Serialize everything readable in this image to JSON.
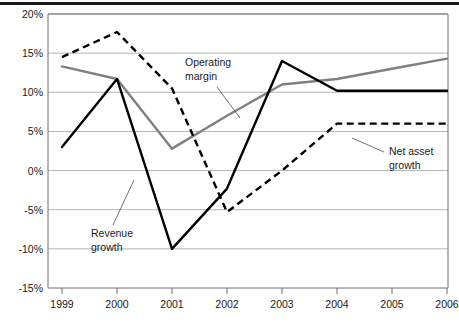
{
  "chart_data": {
    "type": "line",
    "title": "",
    "subtitle": "",
    "xlabel": "",
    "ylabel": "",
    "x": [
      "1999",
      "2000",
      "2001",
      "2002",
      "2003",
      "2004",
      "2005",
      "2006"
    ],
    "categories": [
      "1999",
      "2000",
      "2001",
      "2002",
      "2003",
      "2004",
      "2005",
      "2006"
    ],
    "ylim": [
      -15,
      20
    ],
    "yticks": [
      20,
      15,
      10,
      5,
      0,
      -5,
      -10,
      -15
    ],
    "ytick_labels": [
      "20%",
      "15%",
      "10%",
      "5%",
      "0%",
      "-5%",
      "-10%",
      "-15%"
    ],
    "xtick_labels": [
      "1999",
      "2000",
      "2001",
      "2002",
      "2003",
      "2004",
      "2005",
      "2006"
    ],
    "grid": true,
    "legend": "none",
    "series": [
      {
        "name": "Operating margin",
        "style": "solid",
        "color": "#808080",
        "values": [
          13.3,
          11.7,
          2.8,
          7.0,
          11.0,
          11.7,
          13.0,
          14.3
        ]
      },
      {
        "name": "Revenue growth",
        "style": "solid",
        "color": "#000000",
        "values": [
          3.0,
          11.7,
          -10.0,
          -2.3,
          14.0,
          10.2,
          10.2,
          10.2
        ]
      },
      {
        "name": "Net asset growth",
        "style": "dashed",
        "color": "#000000",
        "values": [
          14.5,
          17.7,
          10.5,
          -5.3,
          0.0,
          6.0,
          6.0,
          6.0
        ]
      }
    ],
    "annotations": [
      {
        "id": "operating-margin",
        "label_line1": "Operating",
        "label_line2": "margin",
        "target_series": "Operating margin"
      },
      {
        "id": "revenue-growth",
        "label_line1": "Revenue",
        "label_line2": "growth",
        "target_series": "Revenue growth"
      },
      {
        "id": "net-asset-growth",
        "label_line1": "Net asset",
        "label_line2": "growth",
        "target_series": "Net asset growth"
      }
    ]
  }
}
